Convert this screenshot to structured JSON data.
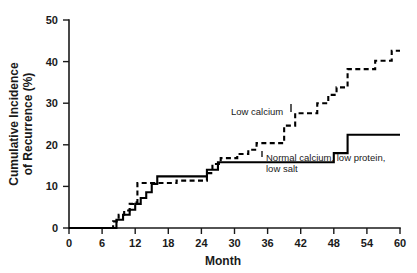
{
  "chart_data": {
    "type": "line",
    "title": "",
    "subtitle": "",
    "xlabel": "Month",
    "ylabel": "Cumulative Incidence of Recurrence (%)",
    "ylabel_line1": "Cumulative Incidence",
    "ylabel_line2": "of Recurrence (%)",
    "xlim": [
      0,
      60
    ],
    "ylim": [
      0,
      50
    ],
    "xticks": [
      0,
      6,
      12,
      18,
      24,
      30,
      36,
      42,
      48,
      54,
      60
    ],
    "yticks": [
      0,
      10,
      20,
      30,
      40,
      50
    ],
    "xtick_labels": [
      "0",
      "6",
      "12",
      "18",
      "24",
      "30",
      "36",
      "42",
      "48",
      "54",
      "60"
    ],
    "ytick_labels": [
      "0",
      "10",
      "20",
      "30",
      "40",
      "50"
    ],
    "grid": false,
    "legend_position": "inline-annotation",
    "step_plot": true,
    "series": [
      {
        "name": "Low calcium",
        "style": "dashed",
        "color": "#000000",
        "annotation": "Low calcium",
        "x": [
          0,
          7,
          8,
          9,
          10,
          11,
          11.6,
          12.4,
          16,
          19.5,
          24,
          25,
          26,
          27.5,
          29,
          30.5,
          32.5,
          34,
          36.5,
          39,
          41,
          43.5,
          45,
          47,
          48.5,
          50.5,
          53,
          55.5,
          57,
          58.5,
          60
        ],
        "y": [
          0,
          0,
          1.6,
          3.2,
          4.2,
          5.8,
          6.2,
          10.8,
          10.8,
          11.4,
          11.4,
          13.2,
          15.4,
          16.8,
          16.8,
          17.8,
          18.8,
          20.4,
          20.4,
          24.6,
          27.6,
          27.6,
          30.0,
          32.0,
          33.8,
          38.2,
          38.2,
          40.2,
          40.2,
          42.6,
          42.6
        ]
      },
      {
        "name": "Normal calcium, low protein, low salt",
        "style": "solid",
        "color": "#000000",
        "annotation": "Normal calcium, low protein, low salt",
        "annotation_line1": "Normal calcium, low protein,",
        "annotation_line2": "low salt",
        "x": [
          0,
          7.3,
          8.6,
          9.8,
          11,
          12,
          13,
          14,
          15,
          16,
          23.5,
          25,
          27,
          35.5,
          48,
          50.5,
          60
        ],
        "y": [
          0,
          0,
          2.0,
          3.2,
          4.4,
          5.8,
          7.2,
          8.6,
          10.6,
          12.4,
          12.4,
          14.0,
          15.8,
          15.8,
          18.0,
          22.4,
          22.4
        ]
      }
    ]
  },
  "annotations": {
    "low_calcium": "Low calcium",
    "normal_calcium_line1": "Normal calcium, low protein,",
    "normal_calcium_line2": "low salt"
  },
  "axes": {
    "x_title": "Month",
    "y_title_line1": "Cumulative Incidence",
    "y_title_line2": "of Recurrence (%)"
  }
}
